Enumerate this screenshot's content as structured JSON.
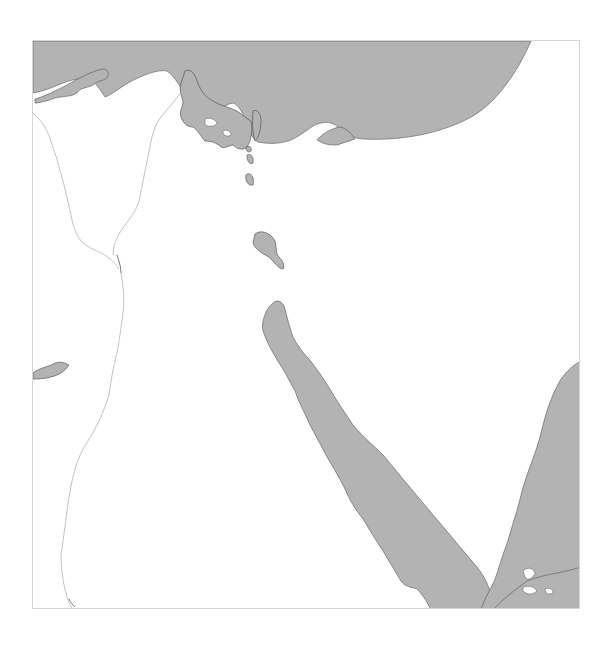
{
  "map": {
    "type": "grayscale relief outline map",
    "colors": {
      "water": "#b3b3b3",
      "land": "#ffffff",
      "frame_border": "#d6d6d6",
      "coastline": "#444444",
      "river": "#a8a8a8"
    },
    "features": [
      {
        "id": "mediterranean-sea",
        "kind": "sea"
      },
      {
        "id": "delta-lakes",
        "kind": "lagoon"
      },
      {
        "id": "bitter-lakes",
        "kind": "lake"
      },
      {
        "id": "gulf-of-suez",
        "kind": "gulf"
      },
      {
        "id": "gulf-of-aqaba",
        "kind": "gulf"
      },
      {
        "id": "red-sea",
        "kind": "sea"
      },
      {
        "id": "fayum-lake",
        "kind": "lake"
      },
      {
        "id": "nile-river",
        "kind": "river"
      }
    ],
    "labels": []
  }
}
